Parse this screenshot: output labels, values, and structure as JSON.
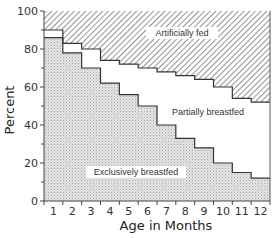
{
  "chart_data": {
    "type": "area",
    "subtype": "stacked-step",
    "title": "",
    "xlabel": "Age in Months",
    "ylabel": "Percent",
    "x": [
      1,
      2,
      3,
      4,
      5,
      6,
      7,
      8,
      9,
      10,
      11,
      12
    ],
    "xlim": [
      0.5,
      12.5
    ],
    "ylim": [
      0,
      100
    ],
    "yticks": [
      0,
      20,
      40,
      60,
      80,
      100
    ],
    "xticks": [
      1,
      2,
      3,
      4,
      5,
      6,
      7,
      8,
      9,
      10,
      11,
      12
    ],
    "grid": false,
    "series": [
      {
        "name": "Exclusively breastfed",
        "values": [
          86,
          78,
          70,
          62,
          56,
          50,
          40,
          33,
          28,
          20,
          15,
          12
        ],
        "fill": "stipple",
        "color": "#d6d6d6"
      },
      {
        "name": "Partially breastfed",
        "values": [
          4,
          5,
          10,
          12,
          16,
          20,
          28,
          33,
          36,
          40,
          39,
          40
        ],
        "fill": "none",
        "color": "#ffffff"
      },
      {
        "name": "Artificially fed",
        "values": [
          10,
          17,
          20,
          26,
          28,
          30,
          32,
          34,
          36,
          40,
          46,
          48
        ],
        "fill": "hatch",
        "color": "#9a9a9a"
      }
    ],
    "cumulative_upper_boundary": [
      90,
      83,
      80,
      74,
      72,
      70,
      68,
      67,
      64,
      60,
      54,
      52
    ],
    "annotations": [
      "Artificially fed",
      "Partially breastfed",
      "Exclusively breastfed"
    ]
  },
  "labels": {
    "xlabel": "Age in Months",
    "ylabel": "Percent",
    "artificial": "Artificially fed",
    "partial": "Partially breastfed",
    "exclusive": "Exclusively breastfed"
  }
}
